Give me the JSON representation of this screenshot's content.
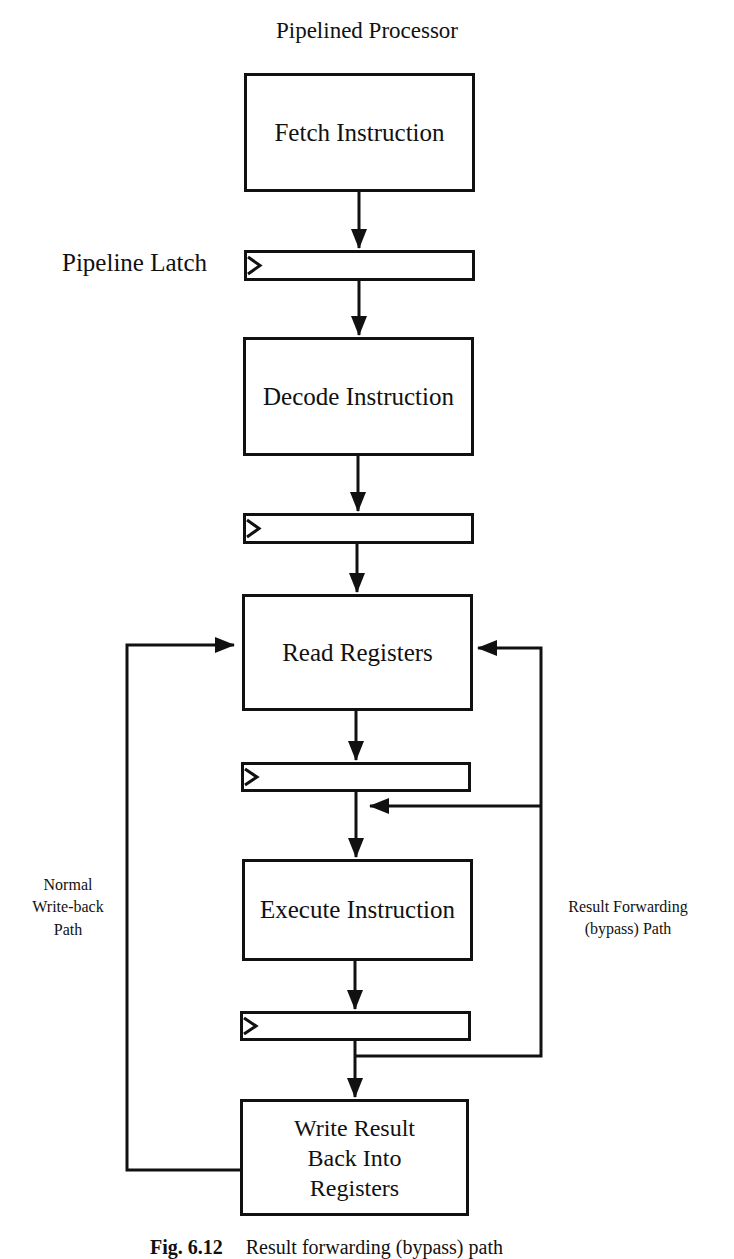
{
  "title": "Pipelined Processor",
  "latch_label": "Pipeline Latch",
  "stages": [
    {
      "id": "fetch",
      "label": "Fetch Instruction"
    },
    {
      "id": "decode",
      "label": "Decode Instruction"
    },
    {
      "id": "read",
      "label": "Read Registers"
    },
    {
      "id": "execute",
      "label": "Execute Instruction"
    },
    {
      "id": "writeback",
      "label": "Write Result\nBack Into\nRegisters"
    }
  ],
  "paths": {
    "writeback_label": "Normal\nWrite-back\nPath",
    "bypass_label": "Result Forwarding\n(bypass) Path"
  },
  "caption": {
    "number": "Fig. 6.12",
    "text": "Result forwarding (bypass) path"
  }
}
